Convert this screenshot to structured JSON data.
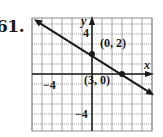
{
  "problem": {
    "number": "61."
  },
  "chart_data": {
    "type": "line",
    "title": "",
    "xlabel": "x",
    "ylabel": "y",
    "xlim": [
      -6,
      6
    ],
    "ylim": [
      -6,
      6
    ],
    "grid": true,
    "tick_labels": {
      "x": [
        "-4"
      ],
      "y": [
        "4",
        "-4"
      ]
    },
    "series": [
      {
        "name": "line",
        "equation": "y = -2/3 x + 2",
        "slope": -0.6667,
        "intercept": 2,
        "x": [
          -6,
          6
        ],
        "y": [
          6,
          -2
        ],
        "arrows": "both"
      }
    ],
    "points": [
      {
        "x": 0,
        "y": 2,
        "label": "(0, 2)"
      },
      {
        "x": 3,
        "y": 0,
        "label": "(3, 0)"
      }
    ]
  },
  "colors": {
    "ink": "#1a1a1a",
    "grid": "#8c8c8c",
    "grid_minor": "#bdbdbd"
  }
}
